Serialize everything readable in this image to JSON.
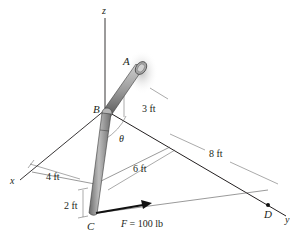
{
  "figure": {
    "axes": {
      "z": "z",
      "x": "x",
      "y": "y"
    },
    "points": {
      "A": "A",
      "B": "B",
      "C": "C",
      "D": "D"
    },
    "angle": "θ",
    "dimensions": {
      "ab_length": "3 ft",
      "x_offset": "4 ft",
      "y_offset": "6 ft",
      "d_distance": "8 ft",
      "c_drop": "2 ft"
    },
    "force": {
      "symbol": "F",
      "equals": " = 100 lb"
    },
    "colors": {
      "line": "#231f20",
      "pipe_fill": "#9a9a9a",
      "pipe_dark": "#5e5e5e",
      "wall_shade": "#c8c8c8"
    }
  }
}
